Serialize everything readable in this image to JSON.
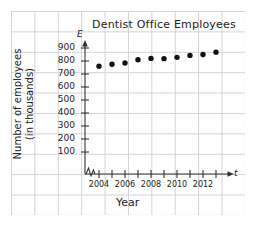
{
  "chart_data": {
    "type": "scatter",
    "title": "Dentist Office Employees",
    "xlabel": "Year",
    "ylabel": "Number of employees (in thousands)",
    "ylabel_line1": "Number of employees",
    "ylabel_line2": "(in thousands)",
    "x_axis_variable": "t",
    "y_axis_variable": "E",
    "grid": true,
    "legend": "none",
    "axis_break_x": true,
    "xlim": [
      2003.4,
      2014.2
    ],
    "ylim": [
      0,
      950
    ],
    "x": [
      2004,
      2005,
      2006,
      2007,
      2008,
      2009,
      2010,
      2011,
      2012,
      2013
    ],
    "values": [
      760,
      775,
      785,
      810,
      820,
      818,
      828,
      843,
      850,
      868
    ],
    "xticks": [
      2004,
      2005,
      2006,
      2007,
      2008,
      2009,
      2010,
      2011,
      2012,
      2013
    ],
    "xtick_labels": [
      "2004",
      "",
      "2006",
      "",
      "2008",
      "",
      "2010",
      "",
      "2012",
      ""
    ],
    "xtick_labels_shown": [
      "2004",
      "2006",
      "2008",
      "2010",
      "2012"
    ],
    "yticks": [
      100,
      200,
      300,
      400,
      500,
      600,
      700,
      800,
      900
    ],
    "ytick_labels": [
      "100",
      "200",
      "300",
      "400",
      "500",
      "600",
      "700",
      "800",
      "900"
    ]
  }
}
